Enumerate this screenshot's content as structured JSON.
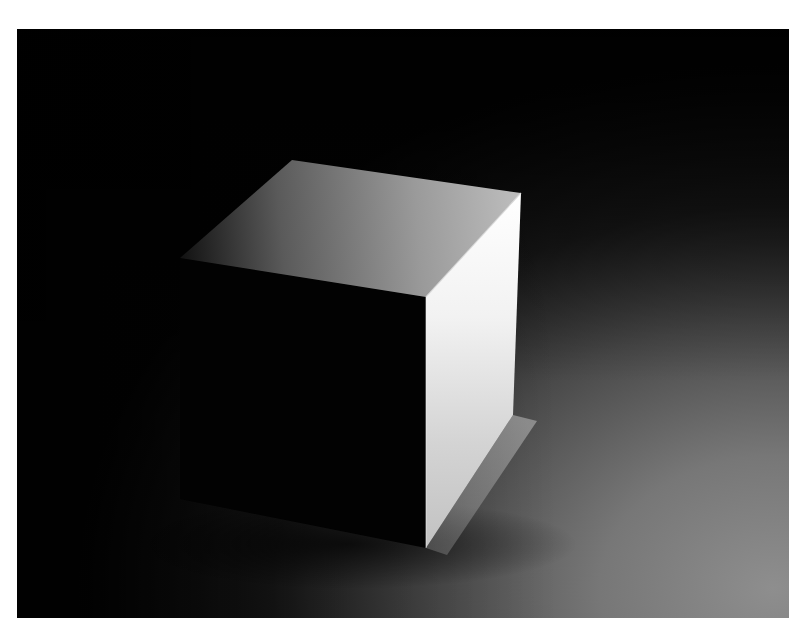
{
  "image": {
    "subject": "white cube on seamless backdrop",
    "frame": {
      "x": 17,
      "y": 29,
      "width": 772,
      "height": 589
    },
    "colors": {
      "page_background": "#ffffff",
      "backdrop_dark": "#030303",
      "floor_mid": "#3a3a3a",
      "floor_light": "#8a8a8a",
      "top_face_dark": "#1a1a1a",
      "top_face_light": "#b8b8b8",
      "right_face_bright": "#fbfbfb",
      "right_face_low": "#c4c4c4",
      "front_face": "#020202"
    },
    "cube_vertices": {
      "top_back_left": [
        163,
        229
      ],
      "top_back": [
        275,
        131
      ],
      "top_right": [
        504,
        164
      ],
      "top_front": [
        409,
        268
      ],
      "bottom_front": [
        409,
        519
      ],
      "bottom_right": [
        496,
        386
      ],
      "bottom_left": [
        163,
        470
      ]
    }
  }
}
